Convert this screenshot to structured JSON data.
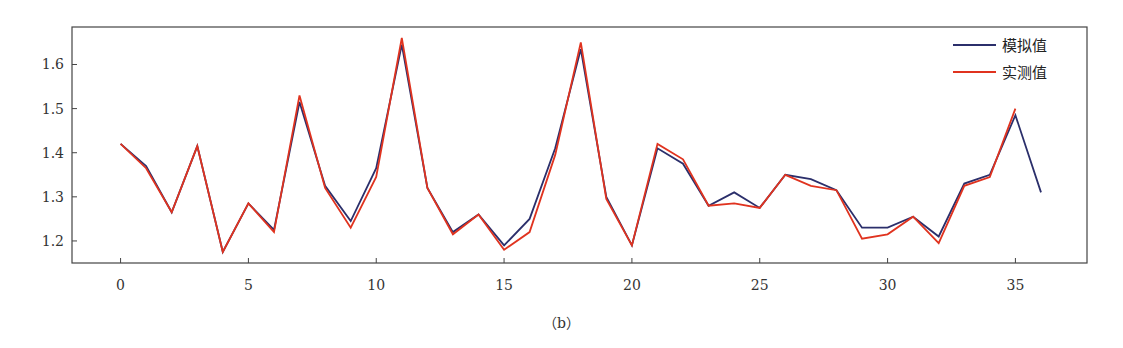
{
  "caption": "（b）",
  "chart_data": {
    "type": "line",
    "title": "",
    "xlabel": "",
    "ylabel": "",
    "xlim": [
      -1.9,
      37.8
    ],
    "ylim": [
      1.15,
      1.685
    ],
    "grid": false,
    "legend_position": "upper right",
    "xticks": [
      0,
      5,
      10,
      15,
      20,
      25,
      30,
      35
    ],
    "xtick_labels": [
      "0",
      "5",
      "10",
      "15",
      "20",
      "25",
      "30",
      "35"
    ],
    "yticks": [
      1.2,
      1.3,
      1.4,
      1.5,
      1.6
    ],
    "ytick_labels": [
      "1.2",
      "1.3",
      "1.4",
      "1.5",
      "1.6"
    ],
    "x": [
      0,
      1,
      2,
      3,
      4,
      5,
      6,
      7,
      8,
      9,
      10,
      11,
      12,
      13,
      14,
      15,
      16,
      17,
      18,
      19,
      20,
      21,
      22,
      23,
      24,
      25,
      26,
      27,
      28,
      29,
      30,
      31,
      32,
      33,
      34,
      35,
      36
    ],
    "series": [
      {
        "name": "模拟值",
        "color": "#2b2f6b",
        "values": [
          1.42,
          1.37,
          1.265,
          1.415,
          1.175,
          1.285,
          1.225,
          1.515,
          1.325,
          1.245,
          1.365,
          1.645,
          1.32,
          1.22,
          1.26,
          1.19,
          1.25,
          1.41,
          1.635,
          1.3,
          1.19,
          1.41,
          1.375,
          1.28,
          1.31,
          1.275,
          1.35,
          1.34,
          1.315,
          1.23,
          1.23,
          1.255,
          1.21,
          1.33,
          1.35,
          1.485,
          1.31
        ]
      },
      {
        "name": "实测值",
        "color": "#e0331f",
        "values": [
          1.42,
          1.365,
          1.265,
          1.415,
          1.175,
          1.285,
          1.22,
          1.53,
          1.32,
          1.23,
          1.345,
          1.66,
          1.32,
          1.215,
          1.26,
          1.18,
          1.22,
          1.395,
          1.65,
          1.295,
          1.19,
          1.42,
          1.385,
          1.28,
          1.285,
          1.275,
          1.35,
          1.325,
          1.315,
          1.205,
          1.215,
          1.255,
          1.195,
          1.325,
          1.345,
          1.5,
          null
        ]
      }
    ]
  }
}
